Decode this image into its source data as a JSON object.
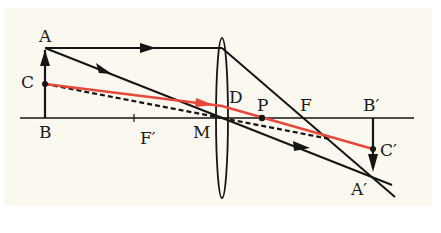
{
  "diagram": {
    "type": "thin converging lens ray diagram",
    "colors": {
      "background": "#fbf8ef",
      "ray": "#151515",
      "highlight_ray": "#e8483a"
    },
    "labels": {
      "A": "A",
      "B": "B",
      "C": "C",
      "F_prime": "F′",
      "M": "M",
      "D": "D",
      "P": "P",
      "F": "F",
      "B_prime": "B′",
      "C_prime": "C′",
      "A_prime": "A′"
    },
    "points": {
      "A": [
        45,
        48
      ],
      "B": [
        45,
        118
      ],
      "C": [
        45,
        84
      ],
      "F_prime": [
        134,
        118
      ],
      "M": [
        222,
        118
      ],
      "P": [
        262,
        118
      ],
      "F": [
        310,
        118
      ],
      "B_prime": [
        373,
        118
      ],
      "C_prime": [
        373,
        149
      ],
      "A_prime": [
        372,
        173
      ]
    },
    "elements": [
      "optical axis",
      "converging lens",
      "object arrow AB",
      "image arrow A'B'",
      "ray parallel to axis from A refracted through F",
      "ray from A through lens center M",
      "red ray from C through P to C'",
      "dashed ray from C through M"
    ]
  }
}
